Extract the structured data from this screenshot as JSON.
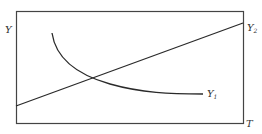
{
  "diagram": {
    "y_axis_label": "Y",
    "x_axis_label": "T",
    "series": [
      {
        "name": "Y",
        "subscript": "1",
        "shape": "decreasing convex curve"
      },
      {
        "name": "Y",
        "subscript": "2",
        "shape": "increasing straight line"
      }
    ],
    "colors": {
      "line": "#2a2a2a",
      "frame": "#444444",
      "background": "#ffffff"
    }
  }
}
